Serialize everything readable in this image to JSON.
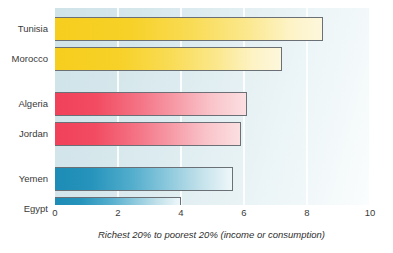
{
  "chart_data": {
    "type": "bar",
    "orientation": "horizontal",
    "title": "",
    "xlabel": "Richest 20% to poorest 20% (income or consumption)",
    "ylabel": "",
    "xlim": [
      0,
      10
    ],
    "xticks": [
      "0",
      "2",
      "4",
      "6",
      "8",
      "10"
    ],
    "grid": true,
    "legend": "none",
    "categories": [
      "Tunisia",
      "Morocco",
      "Algeria",
      "Jordan",
      "Yemen",
      "Egypt"
    ],
    "values": [
      8.5,
      7.2,
      6.1,
      5.9,
      5.65,
      4.0
    ],
    "groups": [
      {
        "name": "group-yellow",
        "color": "#f6ce1f",
        "categories": [
          "Tunisia",
          "Morocco"
        ]
      },
      {
        "name": "group-red",
        "color": "#f1415a",
        "categories": [
          "Algeria",
          "Jordan"
        ]
      },
      {
        "name": "group-blue",
        "color": "#1d8cb6",
        "categories": [
          "Yemen",
          "Egypt"
        ]
      }
    ],
    "bars": [
      {
        "label": "Tunisia",
        "value": 8.5,
        "group": "yellow"
      },
      {
        "label": "Morocco",
        "value": 7.2,
        "group": "yellow"
      },
      {
        "label": "Algeria",
        "value": 6.1,
        "group": "red"
      },
      {
        "label": "Jordan",
        "value": 5.9,
        "group": "red"
      },
      {
        "label": "Yemen",
        "value": 5.65,
        "group": "blue"
      },
      {
        "label": "Egypt",
        "value": 4.0,
        "group": "blue"
      }
    ],
    "colors": {
      "yellow_start": "#f6ce1f",
      "yellow_end": "#fdf7dc",
      "red_start": "#f1415a",
      "red_end": "#fbdfe1",
      "blue_start": "#1d8cb6",
      "blue_end": "#eef7fa",
      "bar_border": "#6b6f76",
      "plot_background_left": "#cfe3e9",
      "plot_background_right": "#fbfdfe",
      "gridline": "#ffffff",
      "text": "#3a3a3a"
    }
  }
}
